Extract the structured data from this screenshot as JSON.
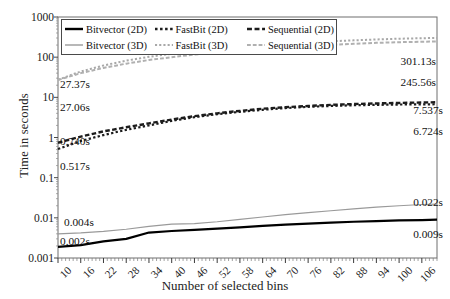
{
  "chart_data": {
    "type": "line",
    "title": "",
    "xlabel": "Number of selected bins",
    "ylabel": "Time in seconds",
    "yscale": "log",
    "ylim": [
      0.001,
      1000
    ],
    "ytick_labels": [
      "1000",
      "100",
      "10",
      "1",
      "0.1",
      "0.01",
      "0.001"
    ],
    "ytick_values": [
      1000,
      100,
      10,
      1,
      0.1,
      0.01,
      0.001
    ],
    "xtick_labels": [
      "10",
      "16",
      "22",
      "28",
      "34",
      "40",
      "46",
      "52",
      "58",
      "64",
      "70",
      "76",
      "82",
      "88",
      "94",
      "100",
      "106"
    ],
    "xlim": [
      10,
      110
    ],
    "grid": false,
    "legend_position": "top-left-inside",
    "x": [
      10,
      16,
      22,
      28,
      34,
      40,
      46,
      52,
      58,
      64,
      70,
      76,
      82,
      88,
      94,
      100,
      106,
      110
    ],
    "series": [
      {
        "name": "Bitvector (2D)",
        "style": "solid",
        "color": "#000000",
        "width": 2.2,
        "values": [
          0.0019,
          0.0021,
          0.0026,
          0.003,
          0.0043,
          0.0047,
          0.005,
          0.0054,
          0.0058,
          0.0063,
          0.0068,
          0.0072,
          0.0076,
          0.008,
          0.0083,
          0.0086,
          0.0088,
          0.009
        ],
        "start_label": "0.002s",
        "end_label": "0.009s"
      },
      {
        "name": "Bitvector (3D)",
        "style": "solid",
        "color": "#9a9a9a",
        "width": 1.2,
        "values": [
          0.004,
          0.0042,
          0.0046,
          0.0052,
          0.0061,
          0.007,
          0.0072,
          0.008,
          0.0092,
          0.0105,
          0.012,
          0.0135,
          0.015,
          0.0168,
          0.0185,
          0.02,
          0.0215,
          0.022
        ],
        "start_label": "0.004s",
        "end_label": "0.022s"
      },
      {
        "name": "FastBit (2D)",
        "style": "dotted",
        "color": "#1c1c1c",
        "width": 2.2,
        "values": [
          0.517,
          0.82,
          1.15,
          1.55,
          2.0,
          2.6,
          3.2,
          3.8,
          4.35,
          4.9,
          5.4,
          5.8,
          6.1,
          6.35,
          6.5,
          6.62,
          6.7,
          6.724
        ],
        "start_label": "0.517s",
        "end_label": "6.724s"
      },
      {
        "name": "FastBit (3D)",
        "style": "dotted",
        "color": "#a8a8a8",
        "width": 2.0,
        "values": [
          27.37,
          44,
          62,
          82,
          102,
          122,
          142,
          162,
          180,
          198,
          215,
          232,
          248,
          262,
          276,
          288,
          296,
          301.13
        ],
        "start_label": "27.37s",
        "end_label": "301.13s"
      },
      {
        "name": "Sequential (2D)",
        "style": "dashed",
        "color": "#1c1c1c",
        "width": 2.4,
        "values": [
          0.74,
          1.05,
          1.42,
          1.8,
          2.25,
          2.8,
          3.4,
          4.0,
          4.6,
          5.2,
          5.7,
          6.1,
          6.5,
          6.8,
          7.05,
          7.25,
          7.45,
          7.537
        ],
        "start_label": "0.740s",
        "end_label": "7.537s"
      },
      {
        "name": "Sequential (3D)",
        "style": "dashed",
        "color": "#b0b0b0",
        "width": 2.0,
        "values": [
          27.06,
          40,
          54,
          69,
          85,
          100,
          116,
          131,
          146,
          160,
          175,
          189,
          202,
          215,
          227,
          236,
          242,
          245.56
        ],
        "start_label": "27.06s",
        "end_label": "245.56s"
      }
    ],
    "annotations_left": [
      {
        "text": "27.37s",
        "x": 60,
        "y": 78
      },
      {
        "text": "27.06s",
        "x": 60,
        "y": 101
      },
      {
        "text": "0.740s",
        "x": 60,
        "y": 135
      },
      {
        "text": "0.517s",
        "x": 60,
        "y": 160
      },
      {
        "text": "0.004s",
        "x": 64,
        "y": 216
      },
      {
        "text": "0.002s",
        "x": 60,
        "y": 235
      }
    ],
    "annotations_right": [
      {
        "text": "301.13s",
        "x": 386,
        "y": 55
      },
      {
        "text": "245.56s",
        "x": 386,
        "y": 76
      },
      {
        "text": "7.537s",
        "x": 393,
        "y": 104
      },
      {
        "text": "6.724s",
        "x": 393,
        "y": 125
      },
      {
        "text": "0.022s",
        "x": 393,
        "y": 196
      },
      {
        "text": "0.009s",
        "x": 393,
        "y": 228
      }
    ]
  },
  "legend": {
    "rows": [
      [
        {
          "label": "Bitvector (2D)",
          "style": "solid",
          "color": "#000000",
          "width": 2.4
        },
        {
          "label": "FastBit (2D)",
          "style": "dotted",
          "color": "#1c1c1c",
          "width": 2.4
        },
        {
          "label": "Sequential (2D)",
          "style": "dashed",
          "color": "#1c1c1c",
          "width": 2.6
        }
      ],
      [
        {
          "label": "Bitvector (3D)",
          "style": "solid",
          "color": "#9a9a9a",
          "width": 1.4
        },
        {
          "label": "FastBit (3D)",
          "style": "dotted",
          "color": "#a8a8a8",
          "width": 2.0
        },
        {
          "label": "Sequential (3D)",
          "style": "dashed",
          "color": "#b0b0b0",
          "width": 2.0
        }
      ]
    ]
  },
  "axes": {
    "y_title": "Time in seconds",
    "x_title": "Number of selected bins"
  },
  "colors": {
    "frame": "#6e6e6e",
    "text": "#111111",
    "background": "#ffffff"
  }
}
